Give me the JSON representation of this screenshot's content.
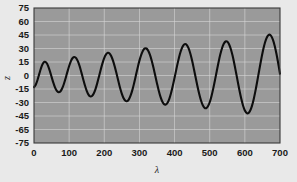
{
  "chart_data": {
    "type": "line",
    "title": "",
    "xlabel": "λ",
    "ylabel": "z",
    "xlim": [
      0,
      700
    ],
    "ylim": [
      -75,
      75
    ],
    "grid": true,
    "legend": null,
    "xticks": [
      0,
      100,
      200,
      300,
      400,
      500,
      600,
      700
    ],
    "xticklabels": [
      "0",
      "100",
      "200",
      "300",
      "400",
      "500",
      "600",
      "700"
    ],
    "yticks": [
      75,
      60,
      45,
      30,
      15,
      0,
      -15,
      -30,
      -45,
      -60,
      -75
    ],
    "yticklabels": [
      "75",
      "60",
      "45",
      "30",
      "15",
      "0",
      "-15",
      "-30",
      "-45",
      "-65",
      "-75"
    ],
    "series": [
      {
        "name": "z",
        "x": [
          0,
          5,
          10,
          15,
          20,
          25,
          30,
          35,
          40,
          45,
          50,
          55,
          60,
          65,
          70,
          75,
          80,
          85,
          90,
          95,
          100,
          105,
          110,
          115,
          120,
          125,
          130,
          135,
          140,
          145,
          150,
          155,
          160,
          165,
          170,
          175,
          180,
          185,
          190,
          195,
          200,
          205,
          210,
          215,
          220,
          225,
          230,
          235,
          240,
          245,
          250,
          255,
          260,
          265,
          270,
          275,
          280,
          285,
          290,
          295,
          300,
          305,
          310,
          315,
          320,
          325,
          330,
          335,
          340,
          345,
          350,
          355,
          360,
          365,
          370,
          375,
          380,
          385,
          390,
          395,
          400,
          405,
          410,
          415,
          420,
          425,
          430,
          435,
          440,
          445,
          450,
          455,
          460,
          465,
          470,
          475,
          480,
          485,
          490,
          495,
          500,
          505,
          510,
          515,
          520,
          525,
          530,
          535,
          540,
          545,
          550,
          555,
          560,
          565,
          570,
          575,
          580,
          585,
          590,
          595,
          600,
          605,
          610,
          615,
          620,
          625,
          630,
          635,
          640,
          645,
          650,
          655,
          660,
          665,
          670,
          675,
          680,
          685,
          690,
          695,
          700
        ],
        "y": [
          -13.0,
          -10.2,
          -5.0,
          1.8,
          8.3,
          13.1,
          15.2,
          14.3,
          10.7,
          5.1,
          -1.5,
          -8.0,
          -13.5,
          -17.2,
          -18.6,
          -17.7,
          -14.5,
          -9.4,
          -3.0,
          4.0,
          10.6,
          16.0,
          19.5,
          20.6,
          19.3,
          15.6,
          10.1,
          3.2,
          -4.1,
          -11.1,
          -17.0,
          -21.2,
          -23.2,
          -22.8,
          -20.0,
          -15.1,
          -8.5,
          -1.0,
          6.7,
          13.8,
          19.6,
          23.5,
          25.2,
          24.5,
          21.4,
          16.3,
          9.6,
          1.9,
          -6.1,
          -13.8,
          -20.4,
          -25.3,
          -28.1,
          -28.5,
          -26.5,
          -22.2,
          -16.0,
          -8.3,
          0.2,
          8.7,
          16.5,
          23.0,
          27.6,
          30.0,
          30.0,
          27.6,
          22.9,
          16.4,
          8.5,
          -0.1,
          -8.8,
          -16.9,
          -23.8,
          -28.9,
          -31.8,
          -32.3,
          -30.3,
          -25.9,
          -19.5,
          -11.5,
          -2.5,
          6.8,
          15.7,
          23.6,
          29.7,
          33.6,
          35.0,
          33.8,
          30.1,
          24.1,
          16.3,
          7.3,
          -2.3,
          -11.7,
          -20.3,
          -27.5,
          -32.8,
          -35.8,
          -36.3,
          -34.2,
          -29.7,
          -23.0,
          -14.6,
          -5.1,
          4.8,
          14.5,
          23.2,
          30.3,
          35.3,
          37.8,
          37.6,
          34.8,
          29.5,
          22.1,
          13.1,
          3.1,
          -7.2,
          -17.2,
          -26.2,
          -33.6,
          -38.9,
          -41.7,
          -41.8,
          -39.2,
          -34.0,
          -26.6,
          -17.4,
          -7.0,
          3.9,
          14.7,
          24.7,
          33.3,
          39.9,
          44.0,
          45.4,
          43.9,
          39.6,
          32.8,
          23.8,
          13.3,
          1.9
        ]
      }
    ]
  }
}
